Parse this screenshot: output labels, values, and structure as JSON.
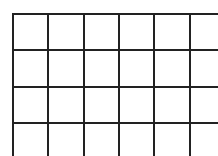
{
  "grid": {
    "rows": 4,
    "columns": 6,
    "line_color": "#222222",
    "background_color": "#ffffff",
    "cells": [
      [
        "",
        "",
        "",
        "",
        "",
        ""
      ],
      [
        "",
        "",
        "",
        "",
        "",
        ""
      ],
      [
        "",
        "",
        "",
        "",
        "",
        ""
      ],
      [
        "",
        "",
        "",
        "",
        "",
        ""
      ]
    ]
  }
}
